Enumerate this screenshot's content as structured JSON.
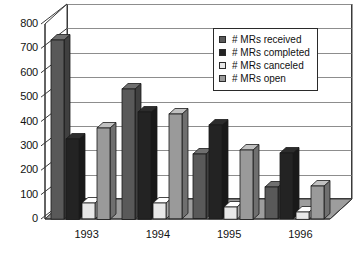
{
  "chart_data": {
    "type": "bar",
    "title": "",
    "subtitle": "",
    "xlabel": "",
    "ylabel": "",
    "categories": [
      "1993",
      "1994",
      "1995",
      "1996"
    ],
    "series": [
      {
        "name": "# MRs received",
        "color": "#595959",
        "values": [
          735,
          535,
          265,
          130
        ]
      },
      {
        "name": "# MRs completed",
        "color": "#232323",
        "values": [
          330,
          440,
          385,
          270
        ]
      },
      {
        "name": "# MRs canceled",
        "color": "#e8e8e8",
        "values": [
          65,
          65,
          50,
          30
        ]
      },
      {
        "name": "# MRs open",
        "color": "#9a9a9a",
        "values": [
          375,
          430,
          285,
          135
        ]
      }
    ],
    "ylim": [
      0,
      800
    ],
    "yticks": [
      0,
      100,
      200,
      300,
      400,
      500,
      600,
      700,
      800
    ],
    "ytick_labels": [
      "0",
      "100",
      "200",
      "300",
      "400",
      "500",
      "600",
      "700",
      "800"
    ],
    "grid": true,
    "grid_axis": "y",
    "legend_position": "top-right",
    "style": "3d-column",
    "background": "#ffffff",
    "axis_color": "#3a3a3a",
    "grid_color": "#8d8d8d",
    "text_color": "#121212"
  }
}
